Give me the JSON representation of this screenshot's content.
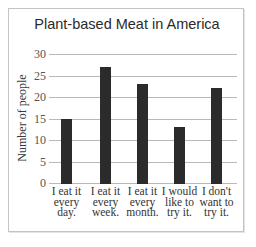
{
  "chart_data": {
    "type": "bar",
    "title": "Plant-based Meat in America",
    "xlabel": "",
    "ylabel": "Number of people",
    "ylim": [
      0,
      30
    ],
    "yticks": [
      0,
      5,
      10,
      15,
      20,
      25,
      30
    ],
    "grid": true,
    "legend": null,
    "categories": [
      "I eat it every day.",
      "I eat it every week.",
      "I eat it every month.",
      "I would like to try it.",
      "I don't want to try it."
    ],
    "category_lines": [
      [
        "I eat it",
        "every",
        "day."
      ],
      [
        "I eat it",
        "every",
        "week."
      ],
      [
        "I eat it",
        "every",
        "month."
      ],
      [
        "I would",
        "like to",
        "try it."
      ],
      [
        "I don't",
        "want to",
        "try it."
      ]
    ],
    "values": [
      15,
      27,
      23,
      13,
      22
    ],
    "bar_color": "#2b2b2b"
  }
}
